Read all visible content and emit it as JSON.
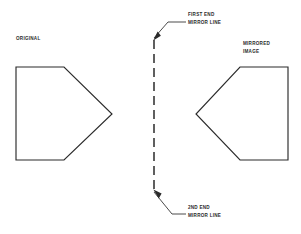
{
  "diagram": {
    "colors": {
      "stroke": "#2b2b2b",
      "background": "#ffffff"
    },
    "labels": {
      "original": "ORIGINAL",
      "mirrored_line1": "MIRRORED",
      "mirrored_line2": "IMAGE",
      "first_end_line1": "FIRST END",
      "first_end_line2": "MIRROR LINE",
      "second_end_line1": "2ND END",
      "second_end_line2": "MIRROR LINE"
    },
    "shapes": {
      "original_polygon": {
        "name": "original-pentagon",
        "points": "16,67 64,67 112,114 64,160 16,160"
      },
      "mirrored_polygon": {
        "name": "mirrored-pentagon",
        "points": "288,67 240,67 196,114 240,160 288,160"
      }
    },
    "mirror_line": {
      "name": "vertical-dashed-mirror-axis",
      "x": 154,
      "y_top": 40,
      "y_bottom": 190,
      "dash_pattern": "9 5"
    },
    "leaders": {
      "first_end": "154,38 168,22 186,22",
      "second_end": "154,192 172,214 186,214"
    }
  }
}
